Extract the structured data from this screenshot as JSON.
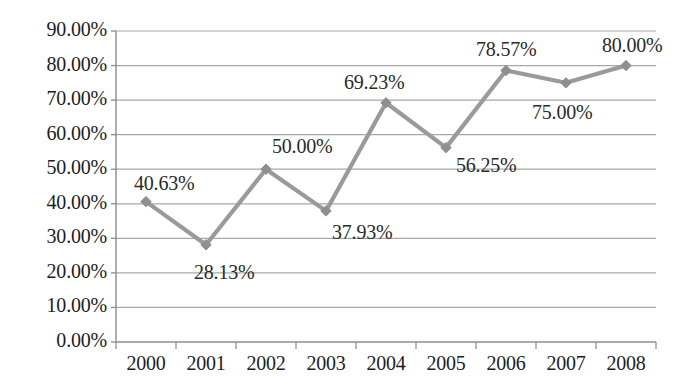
{
  "chart_data": {
    "type": "line",
    "title": "",
    "xlabel": "",
    "ylabel": "",
    "categories": [
      "2000",
      "2001",
      "2002",
      "2003",
      "2004",
      "2005",
      "2006",
      "2007",
      "2008"
    ],
    "values": [
      40.63,
      28.13,
      50.0,
      37.93,
      69.23,
      56.25,
      78.57,
      75.0,
      80.0
    ],
    "data_labels": [
      "40.63%",
      "28.13%",
      "50.00%",
      "37.93%",
      "69.23%",
      "56.25%",
      "78.57%",
      "75.00%",
      "80.00%"
    ],
    "ylim": [
      0,
      90
    ],
    "ytick_values": [
      0,
      10,
      20,
      30,
      40,
      50,
      60,
      70,
      80,
      90
    ],
    "ytick_labels": [
      "0.00%",
      "10.00%",
      "20.00%",
      "30.00%",
      "40.00%",
      "50.00%",
      "60.00%",
      "70.00%",
      "80.00%",
      "90.00%"
    ],
    "grid": true,
    "legend": "none",
    "series": [
      {
        "name": "",
        "values": [
          40.63,
          28.13,
          50.0,
          37.93,
          69.23,
          56.25,
          78.57,
          75.0,
          80.0
        ],
        "color": "#9a9a9a",
        "marker": "diamond"
      }
    ],
    "label_offsets": [
      {
        "dx": -12,
        "dy": -30
      },
      {
        "dx": -12,
        "dy": 16
      },
      {
        "dx": 6,
        "dy": -34
      },
      {
        "dx": 6,
        "dy": 10
      },
      {
        "dx": -42,
        "dy": -32
      },
      {
        "dx": 10,
        "dy": 6
      },
      {
        "dx": -30,
        "dy": -32
      },
      {
        "dx": -34,
        "dy": 18
      },
      {
        "dx": -24,
        "dy": -32
      }
    ],
    "colors": {
      "line": "#9a9a9a",
      "marker": "#8f8f8f",
      "grid": "#a8a8a8",
      "axis": "#8c8c8c",
      "text": "#1d1d1d"
    }
  },
  "axes": {
    "y_axis_name": "percentage-axis",
    "x_axis_name": "year-axis"
  }
}
